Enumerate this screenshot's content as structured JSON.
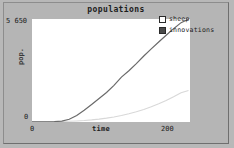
{
  "widget": {
    "type": "plot-widget",
    "background_color": "#b5b5b5"
  },
  "chart_data": {
    "type": "line",
    "title": "populations",
    "xlabel": "time",
    "ylabel": "pop.",
    "xlim": [
      0,
      200
    ],
    "ylim": [
      0,
      5650
    ],
    "xticks": [
      "0",
      "200"
    ],
    "yticks": [
      "0",
      "5 650"
    ],
    "grid": false,
    "legend_position": "top-right",
    "series": [
      {
        "name": "sheep",
        "color": "#d8d8d8",
        "swatch_fill": "#ffffff",
        "x": [
          0,
          10,
          20,
          30,
          40,
          50,
          60,
          70,
          80,
          90,
          100,
          110,
          120,
          130,
          140,
          150,
          160,
          170,
          180,
          190,
          200,
          210
        ],
        "values": [
          10,
          12,
          15,
          20,
          28,
          40,
          58,
          82,
          115,
          158,
          212,
          278,
          358,
          452,
          562,
          688,
          832,
          995,
          1178,
          1382,
          1608,
          1730
        ]
      },
      {
        "name": "innovations",
        "color": "#6a6a6a",
        "swatch_fill": "#4a4a4a",
        "x": [
          0,
          10,
          20,
          30,
          40,
          50,
          60,
          70,
          80,
          90,
          100,
          110,
          120,
          130,
          140,
          150,
          160,
          170,
          180,
          190,
          200,
          210
        ],
        "values": [
          5,
          8,
          12,
          20,
          48,
          150,
          360,
          640,
          960,
          1290,
          1620,
          2010,
          2460,
          2810,
          3200,
          3620,
          4010,
          4390,
          4760,
          5120,
          5450,
          5640
        ]
      }
    ]
  },
  "legend": {
    "entries": [
      {
        "label": "sheep"
      },
      {
        "label": "innovations"
      }
    ]
  }
}
